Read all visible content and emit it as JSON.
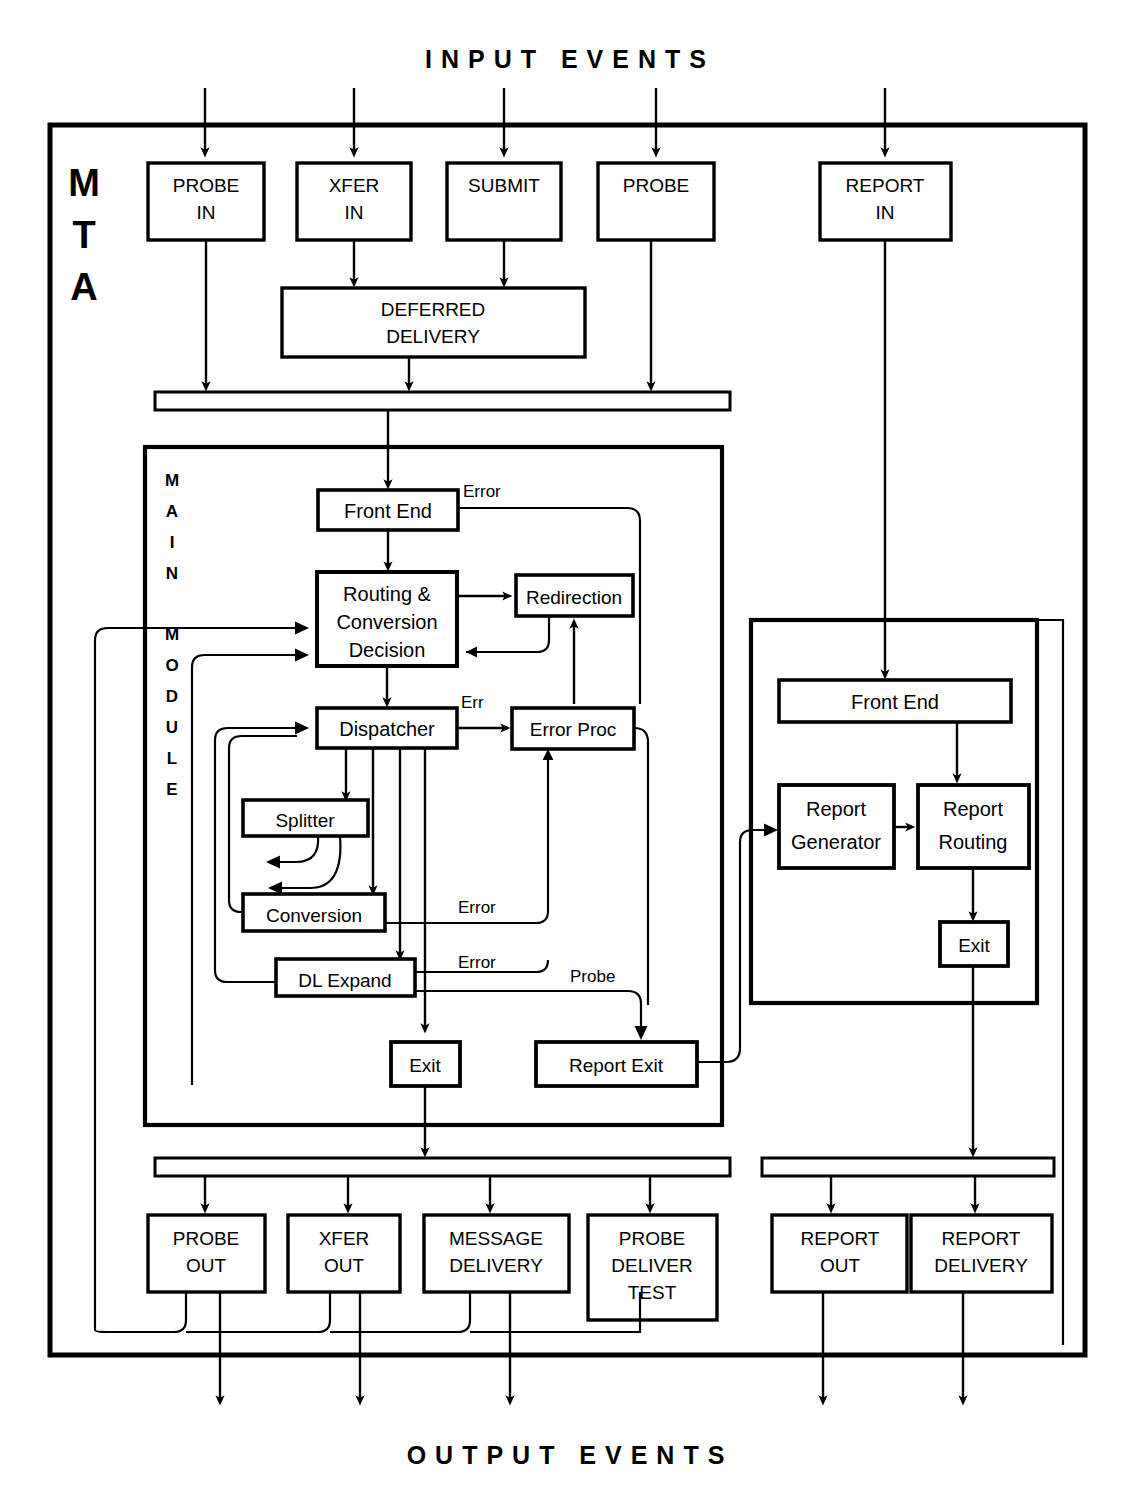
{
  "title_top": "INPUT  EVENTS",
  "title_bottom": "OUTPUT  EVENTS",
  "container": {
    "label": "MTA",
    "letters": [
      "M",
      "T",
      "A"
    ]
  },
  "main_module": {
    "label": "MAIN MODULE",
    "letters": [
      "M",
      "A",
      "I",
      "N",
      "M",
      "O",
      "D",
      "U",
      "L",
      "E"
    ],
    "boxes": [
      {
        "id": "front-end",
        "label": "Front End"
      },
      {
        "id": "routing-conversion-decision",
        "label": "Routing & Conversion Decision",
        "lines": [
          "Routing &",
          "Conversion",
          "Decision"
        ]
      },
      {
        "id": "redirection",
        "label": "Redirection"
      },
      {
        "id": "dispatcher",
        "label": "Dispatcher"
      },
      {
        "id": "error-proc",
        "label": "Error  Proc"
      },
      {
        "id": "splitter",
        "label": "Splitter"
      },
      {
        "id": "conversion",
        "label": "Conversion"
      },
      {
        "id": "dl-expand",
        "label": "DL Expand"
      },
      {
        "id": "exit",
        "label": "Exit"
      },
      {
        "id": "report-exit",
        "label": "Report  Exit"
      }
    ],
    "edge_labels": [
      {
        "id": "front-end-error",
        "text": "Error"
      },
      {
        "id": "dispatcher-err",
        "text": "Err"
      },
      {
        "id": "conversion-error",
        "text": "Error"
      },
      {
        "id": "dl-expand-error",
        "text": "Error"
      },
      {
        "id": "dl-expand-probe",
        "text": "Probe"
      }
    ]
  },
  "report_module": {
    "boxes": [
      {
        "id": "report-front-end",
        "label": "Front End"
      },
      {
        "id": "report-generator",
        "label": "Report Generator",
        "lines": [
          "Report",
          "Generator"
        ]
      },
      {
        "id": "report-routing",
        "label": "Report Routing",
        "lines": [
          "Report",
          "Routing"
        ]
      },
      {
        "id": "report-exit-box",
        "label": "Exit"
      }
    ]
  },
  "inputs": [
    {
      "id": "probe-in",
      "lines": [
        "PROBE",
        "IN"
      ]
    },
    {
      "id": "xfer-in",
      "lines": [
        "XFER",
        "IN"
      ]
    },
    {
      "id": "submit",
      "lines": [
        "SUBMIT"
      ]
    },
    {
      "id": "probe",
      "lines": [
        "PROBE"
      ]
    },
    {
      "id": "report-in",
      "lines": [
        "REPORT",
        "IN"
      ]
    }
  ],
  "deferred_delivery": {
    "id": "deferred-delivery",
    "lines": [
      "DEFERRED",
      "DELIVERY"
    ]
  },
  "outputs": [
    {
      "id": "probe-out",
      "lines": [
        "PROBE",
        "OUT"
      ]
    },
    {
      "id": "xfer-out",
      "lines": [
        "XFER",
        "OUT"
      ]
    },
    {
      "id": "message-delivery",
      "lines": [
        "MESSAGE",
        "DELIVERY"
      ]
    },
    {
      "id": "probe-deliver-test",
      "lines": [
        "PROBE",
        "DELIVER",
        "TEST"
      ]
    },
    {
      "id": "report-out",
      "lines": [
        "REPORT",
        "OUT"
      ]
    },
    {
      "id": "report-delivery",
      "lines": [
        "REPORT",
        "DELIVERY"
      ]
    }
  ],
  "colors": {
    "ink": "#000000",
    "paper": "#ffffff"
  }
}
